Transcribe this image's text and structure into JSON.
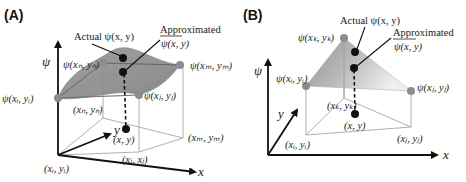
{
  "panels": [
    {
      "id": "A",
      "label": "(A)",
      "axis_labels": {
        "psi": "ψ",
        "x": "x",
        "y": "y"
      },
      "annotations": {
        "actual": "Actual  ψ(x, y)",
        "approximated_title": "Approximated",
        "approximated_value": "ψ(x, y)"
      },
      "node_labels": {
        "psi_i": "ψ(xᵢ, yᵢ)",
        "psi_n": "ψ(xₙ, yₙ)",
        "psi_m": "ψ(xₘ, yₘ)",
        "psi_j": "ψ(xⱼ, yⱼ)"
      },
      "base_labels": {
        "i": "(xᵢ, yᵢ)",
        "n": "(xₙ, yₙ)",
        "m": "(xₘ, yₘ)",
        "j": "(xⱼ, xⱼ)",
        "point": "(x, y)"
      }
    },
    {
      "id": "B",
      "label": "(B)",
      "axis_labels": {
        "psi": "ψ",
        "x": "x",
        "y": "y"
      },
      "annotations": {
        "actual": "Actual  ψ(x, y)",
        "approximated_title": "Approximated",
        "approximated_value": "ψ(x, y)"
      },
      "node_labels": {
        "psi_k": "ψ(xₖ, yₖ)",
        "psi_i": "ψ(xᵢ, yᵢ)",
        "psi_j": "ψ(xⱼ, yⱼ)"
      },
      "base_labels": {
        "i": "(xᵢ, yᵢ)",
        "k": "(xₖ, yₖ)",
        "j": "(xⱼ, yⱼ)",
        "point": "(x, y)"
      }
    }
  ],
  "colors": {
    "surface_dark": "#8a8a8a",
    "surface_light": "#e6e6e6",
    "node": "#8c8c8c",
    "point": "#111111"
  }
}
